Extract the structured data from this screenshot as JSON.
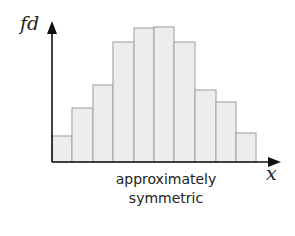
{
  "chart_data": {
    "type": "bar",
    "subtype": "histogram",
    "title": "",
    "xlabel": "x",
    "ylabel": "fd",
    "caption": "approximately symmetric",
    "categories": [
      "1",
      "2",
      "3",
      "4",
      "5",
      "6",
      "7",
      "8",
      "9",
      "10"
    ],
    "values": [
      26,
      54,
      77,
      120,
      134,
      135,
      120,
      72,
      60,
      29
    ],
    "ylim": [
      0,
      145
    ],
    "grid": false,
    "legend": null,
    "bar_color": "#ededed",
    "bar_edge_color": "#aaaaaa",
    "axis_color": "#111111",
    "bins_px": [
      52,
      72,
      93,
      113,
      134,
      154,
      174,
      195,
      216,
      236,
      256
    ]
  },
  "labels": {
    "y_axis": "fd",
    "x_axis": "x",
    "caption_line1": "approximately",
    "caption_line2": "symmetric"
  }
}
